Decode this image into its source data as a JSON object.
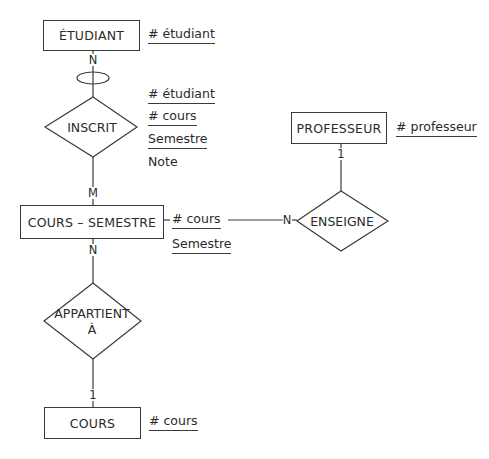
{
  "diagram": {
    "type": "entity-relationship",
    "entities": [
      {
        "id": "etudiant",
        "label": "ÉTUDIANT",
        "attributes": [
          {
            "text": "# étudiant",
            "key": true
          }
        ]
      },
      {
        "id": "professeur",
        "label": "PROFESSEUR",
        "attributes": [
          {
            "text": "# professeur",
            "key": true
          }
        ]
      },
      {
        "id": "cours_semestre",
        "label": "COURS – SEMESTRE",
        "attributes": [
          {
            "text": "# cours",
            "key": true
          },
          {
            "text": "Semestre",
            "key": true
          }
        ]
      },
      {
        "id": "cours",
        "label": "COURS",
        "attributes": [
          {
            "text": "# cours",
            "key": true
          }
        ]
      }
    ],
    "relationships": [
      {
        "id": "inscrit",
        "label": "INSCRIT",
        "attributes": [
          {
            "text": "# étudiant",
            "key": true
          },
          {
            "text": "# cours",
            "key": true
          },
          {
            "text": "Semestre",
            "key": true
          },
          {
            "text": "Note",
            "key": false
          }
        ]
      },
      {
        "id": "enseigne",
        "label": "ENSEIGNE"
      },
      {
        "id": "appartient",
        "label_line1": "APPARTIENT",
        "label_line2": "À"
      }
    ],
    "cardinalities": {
      "etudiant_inscrit": "N",
      "inscrit_cours_semestre": "M",
      "cours_semestre_enseigne": "N",
      "professeur_enseigne": "1",
      "cours_semestre_appartient": "N",
      "appartient_cours": "1"
    }
  }
}
